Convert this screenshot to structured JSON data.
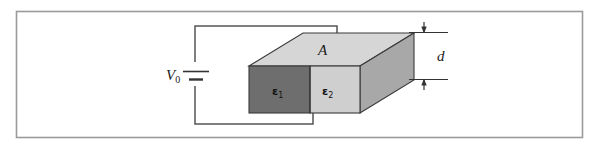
{
  "figure": {
    "frame": {
      "present": true,
      "stroke_color": "#9a9a9a",
      "x": 16,
      "y": 11,
      "width": 567,
      "height": 127
    },
    "background_color": "#ffffff",
    "labels": {
      "voltage_source": "V",
      "voltage_source_subscript": "0",
      "area": "A",
      "thickness": "d",
      "dielectric_1": "ε",
      "dielectric_1_subscript": "1",
      "dielectric_2": "ε",
      "dielectric_2_subscript": "2"
    },
    "colors": {
      "top_face": "#d6d6d6",
      "front_face_left": "#6e6e6e",
      "front_face_right": "#cfcfcf",
      "side_face": "#a8a8a8",
      "outline": "#3a3a3a",
      "wire": "#555555",
      "text": "#1a1a1a"
    },
    "components": [
      {
        "name": "battery",
        "label": "V₀",
        "type": "dc-voltage-source"
      },
      {
        "name": "slab",
        "type": "rectangular-dielectric-slab"
      },
      {
        "name": "dimension-d",
        "type": "dimension-arrow",
        "label": "d"
      },
      {
        "name": "leader-A",
        "type": "leader-line",
        "label": "A"
      }
    ],
    "geometry": {
      "box": {
        "front_top_left_x": 249,
        "front_top_left_y": 66,
        "front_top_right_x": 360,
        "front_top_right_y": 66,
        "front_bottom_left_x": 249,
        "front_bottom_left_y": 113,
        "front_bottom_right_x": 360,
        "front_bottom_right_y": 113,
        "back_top_left_x": 303,
        "back_top_left_y": 33,
        "back_top_right_x": 414,
        "back_top_right_y": 33,
        "back_bottom_right_x": 414,
        "back_bottom_right_y": 80,
        "dielectric_split_x": 310
      },
      "circuit": {
        "battery_x": 195,
        "battery_y": 74,
        "top_wire_y": 26,
        "top_wire_end_x": 337,
        "top_wire_drop_y": 56,
        "bottom_wire_y": 124,
        "bottom_wire_start_x": 313,
        "bottom_wire_drop_y": 113
      },
      "dimension": {
        "line_x": 432,
        "top_y": 33,
        "bottom_y": 80,
        "ext_left_x": 405,
        "ext_right_x": 448
      }
    }
  }
}
